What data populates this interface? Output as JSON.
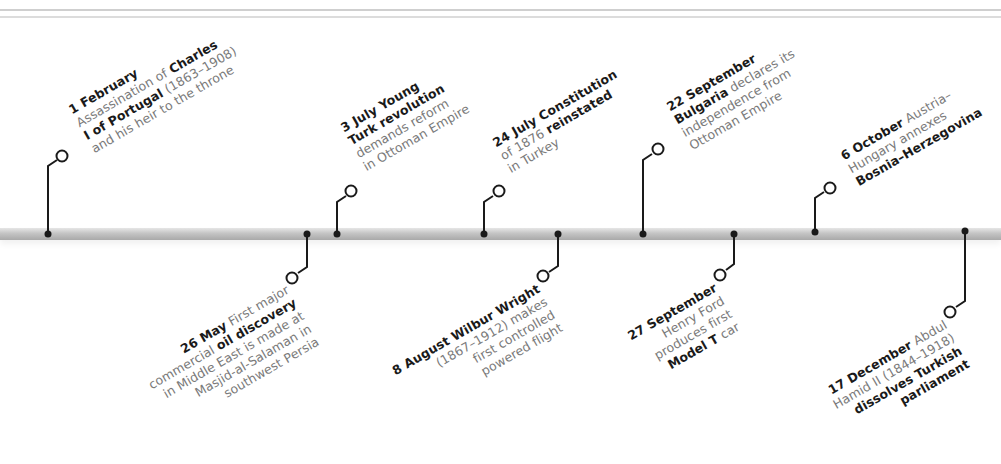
{
  "colors": {
    "line": "#1a1a1a",
    "text": "#7a7a7a",
    "bold": "#1a1a1a",
    "bar": "#bdbdbd"
  },
  "events": [
    {
      "id": "feb1",
      "position": "above",
      "date": "1 February",
      "lines": [
        "Assassination of ",
        "Charles",
        "I of Portugal",
        " (1863–1908)",
        "and his heir to the throne"
      ],
      "l1a": "1 February",
      "l2a": "Assassination of ",
      "l2b": "Charles",
      "l3a": "I of Portugal",
      "l3b": " (1863–1908)",
      "l4a": "and his heir to the throne"
    },
    {
      "id": "may26",
      "position": "below",
      "date": "26 May",
      "l1a": "26 May",
      "l1b": " First major",
      "l2a": "commercial ",
      "l2b": "oil discovery",
      "l3a": "in Middle East is made at",
      "l4a": "Masjid-al-Salaman in",
      "l5a": "southwest Persia"
    },
    {
      "id": "jul3",
      "position": "above",
      "date": "3 July",
      "l1a": "3 July Young",
      "l2a": "Turk revolution",
      "l3a": "demands reform",
      "l4a": "in Ottoman Empire"
    },
    {
      "id": "jul24",
      "position": "above",
      "date": "24 July",
      "l1a": "24 July Constitution",
      "l2a": "of 1876 ",
      "l2b": "reinstated",
      "l3a": "in Turkey"
    },
    {
      "id": "aug8",
      "position": "below",
      "date": "8 August",
      "l1a": "8 August Wilbur Wright",
      "l2a": "(1867–1912) makes",
      "l3a": "first controlled",
      "l4a": "powered flight"
    },
    {
      "id": "sep22",
      "position": "above",
      "date": "22 September",
      "l1a": "22 September",
      "l2a": "Bulgaria",
      "l2b": " declares its",
      "l3a": "independence from",
      "l4a": "Ottoman Empire"
    },
    {
      "id": "sep27",
      "position": "below",
      "date": "27 September",
      "l1a": "27 September",
      "l2a": "Henry Ford",
      "l3a": "produces first",
      "l4a": "Model T",
      "l4b": " car"
    },
    {
      "id": "oct6",
      "position": "above",
      "date": "6 October",
      "l1a": "6 October",
      "l1b": " Austria–",
      "l2a": "Hungary annexes",
      "l3a": "Bosnia–Herzegovina"
    },
    {
      "id": "dec17",
      "position": "below",
      "date": "17 December",
      "l1a": "17 December",
      "l1b": " Abdul",
      "l2a": "Hamid II (1844–1918)",
      "l3a": "dissolves Turkish",
      "l4a": "parliament"
    }
  ]
}
